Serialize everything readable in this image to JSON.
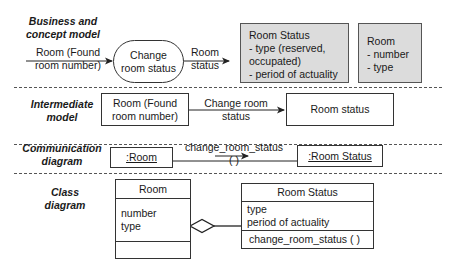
{
  "sections": {
    "business": {
      "label": "Business and concept model",
      "input_flow": "Room (Found room number)",
      "process": "Change room status",
      "output_flow": "Room status",
      "entity_room_status": {
        "title": "Room Status",
        "lines": [
          "- type (reserved,",
          "occupated)",
          "- period of actuality"
        ]
      },
      "entity_room": {
        "title": "Room",
        "lines": [
          "- number",
          "- type"
        ]
      }
    },
    "intermediate": {
      "label": "Intermediate model",
      "source_box": "Room (Found room number)",
      "arrow_label": "Change room status",
      "target_box": "Room status"
    },
    "communication": {
      "label": "Communication diagram",
      "source_object": ":Room",
      "message": "change_room_status ( )",
      "target_object": ":Room Status"
    },
    "class": {
      "label": "Class diagram",
      "room": {
        "name": "Room",
        "attributes": [
          "number",
          "type"
        ],
        "operations": []
      },
      "room_status": {
        "name": "Room Status",
        "attributes": [
          "type",
          "period of actuality"
        ],
        "operations": [
          "change_room_status ( )"
        ]
      },
      "relation": "aggregation"
    }
  },
  "colors": {
    "line": "#222222",
    "entity_fill": "#dcdcdc",
    "dash": "#555555"
  }
}
